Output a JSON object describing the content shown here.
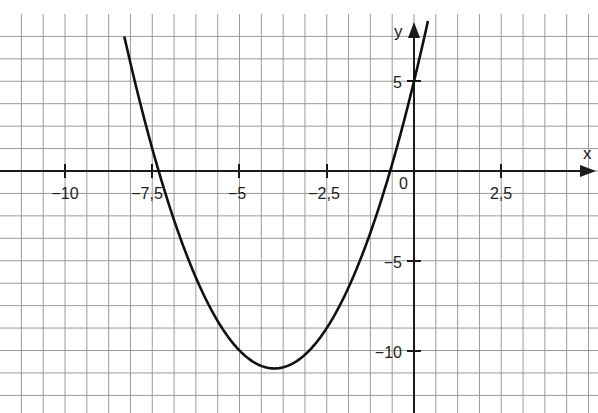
{
  "chart_data": {
    "type": "line",
    "title": "",
    "function": "f(x) = x^2 + 8x + 5 = (x + 4)^2 - 11",
    "xlabel": "x",
    "ylabel": "y",
    "xlim": [
      -11.875,
      5.3
    ],
    "ylim": [
      -13.5,
      8.5
    ],
    "grid": true,
    "grid_step_x": 0.625,
    "grid_step_y": 1.25,
    "x_ticks": [
      -10,
      -7.5,
      -5,
      -2.5,
      2.5
    ],
    "x_tick_labels": [
      "−10",
      "−7,5",
      "−5",
      "−2,5",
      "2,5"
    ],
    "y_ticks": [
      5,
      -5,
      -10
    ],
    "y_tick_labels": [
      "5",
      "−5",
      "−10"
    ],
    "origin_label": "0",
    "vertex": [
      -4,
      -11
    ],
    "roots": [
      -7.32,
      -0.68
    ],
    "y_intercept": 5,
    "series": [
      {
        "name": "parabola",
        "x": [
          -8.5,
          -8,
          -7.5,
          -7,
          -6,
          -5,
          -4,
          -3,
          -2,
          -1,
          0,
          0.5
        ],
        "y": [
          9.25,
          5,
          1.25,
          -2,
          -7,
          -10,
          -11,
          -10,
          -7,
          -2,
          5,
          9.25
        ]
      }
    ]
  },
  "labels": {
    "x_axis": "x",
    "y_axis": "y",
    "origin": "0",
    "xt0": "−10",
    "xt1": "−7,5",
    "xt2": "−5",
    "xt3": "−2,5",
    "xt4": "2,5",
    "yt0": "5",
    "yt1": "−5",
    "yt2": "−10"
  }
}
